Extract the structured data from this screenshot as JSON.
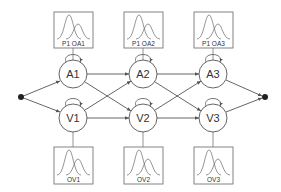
{
  "diagram": {
    "type": "coupled-hmm",
    "colors": {
      "line": "#555555",
      "box": "#777777",
      "node_stroke": "#555555",
      "dot": "#222222",
      "curve": "#666666"
    },
    "start_node": {
      "x": 21,
      "y": 97
    },
    "end_node": {
      "x": 265,
      "y": 97
    },
    "hidden_states": [
      {
        "id": "A1",
        "label": "A1",
        "x": 73,
        "y": 74
      },
      {
        "id": "A2",
        "label": "A2",
        "x": 143,
        "y": 74
      },
      {
        "id": "A3",
        "label": "A3",
        "x": 213,
        "y": 74
      },
      {
        "id": "V1",
        "label": "V1",
        "x": 73,
        "y": 118
      },
      {
        "id": "V2",
        "label": "V2",
        "x": 143,
        "y": 118
      },
      {
        "id": "V3",
        "label": "V3",
        "x": 213,
        "y": 118
      }
    ],
    "emission_boxes": [
      {
        "id": "OA1",
        "label": "P1 OA1",
        "attached_to": "A1",
        "position": "top"
      },
      {
        "id": "OA2",
        "label": "P1 OA2",
        "attached_to": "A2",
        "position": "top"
      },
      {
        "id": "OA3",
        "label": "P1 OA3",
        "attached_to": "A3",
        "position": "top"
      },
      {
        "id": "OV1",
        "label": "OV1",
        "attached_to": "V1",
        "position": "bottom"
      },
      {
        "id": "OV2",
        "label": "OV2",
        "attached_to": "V2",
        "position": "bottom"
      },
      {
        "id": "OV3",
        "label": "OV3",
        "attached_to": "V3",
        "position": "bottom"
      }
    ],
    "edges": [
      [
        "start",
        "A1"
      ],
      [
        "start",
        "V1"
      ],
      [
        "A1",
        "A2"
      ],
      [
        "A1",
        "V2"
      ],
      [
        "V1",
        "V2"
      ],
      [
        "V1",
        "A2"
      ],
      [
        "A2",
        "A3"
      ],
      [
        "A2",
        "V3"
      ],
      [
        "V2",
        "V3"
      ],
      [
        "V2",
        "A3"
      ],
      [
        "A3",
        "end"
      ],
      [
        "V3",
        "end"
      ],
      [
        "A1",
        "A1"
      ],
      [
        "A2",
        "A2"
      ],
      [
        "A3",
        "A3"
      ],
      [
        "V1",
        "V1"
      ],
      [
        "V2",
        "V2"
      ],
      [
        "V3",
        "V3"
      ]
    ]
  }
}
